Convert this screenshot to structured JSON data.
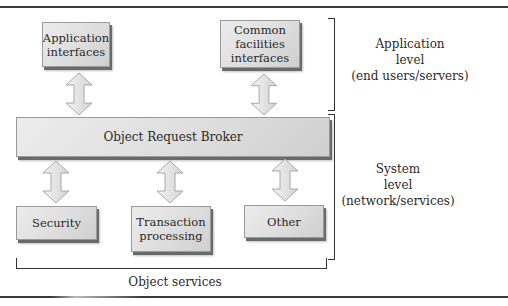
{
  "diagram": {
    "top_boxes": [
      {
        "label_lines": [
          "Application",
          "interfaces"
        ]
      },
      {
        "label_lines": [
          "Common",
          "facilities",
          "interfaces"
        ]
      }
    ],
    "orb": {
      "label": "Object Request Broker"
    },
    "bottom_boxes": [
      {
        "label_lines": [
          "Security"
        ]
      },
      {
        "label_lines": [
          "Transaction",
          "processing"
        ]
      },
      {
        "label_lines": [
          "Other"
        ]
      }
    ],
    "levels": {
      "application": {
        "lines": [
          "Application",
          "level",
          "(end users/servers)"
        ]
      },
      "system": {
        "lines": [
          "System",
          "level",
          "(network/services)"
        ]
      }
    },
    "object_services_label": "Object services",
    "arrows": [
      {
        "from": "Application interfaces",
        "to": "Object Request Broker",
        "type": "bidirectional"
      },
      {
        "from": "Common facilities interfaces",
        "to": "Object Request Broker",
        "type": "bidirectional"
      },
      {
        "from": "Object Request Broker",
        "to": "Security",
        "type": "bidirectional"
      },
      {
        "from": "Object Request Broker",
        "to": "Transaction processing",
        "type": "bidirectional"
      },
      {
        "from": "Object Request Broker",
        "to": "Other",
        "type": "bidirectional"
      }
    ],
    "colors": {
      "box_fill": "#dedede",
      "box_shadow": "#6a6a6a",
      "arrow_fill": "#e4e4e4",
      "arrow_stroke": "#a8a8a8",
      "text": "#2a2a2a",
      "rules": "#3a3a3a"
    }
  }
}
